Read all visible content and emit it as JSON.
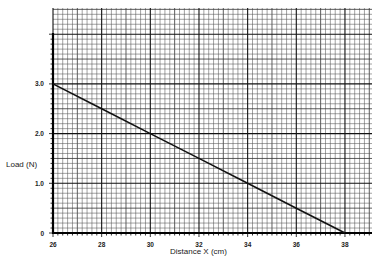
{
  "chart_data": {
    "type": "line",
    "title": "",
    "xlabel": "Distance X (cm)",
    "ylabel": "Load (N)",
    "xlim": [
      26,
      39.1
    ],
    "ylim": [
      0,
      4.5
    ],
    "x_ticks": [
      26,
      28,
      30,
      32,
      34,
      36,
      38
    ],
    "x_tick_labels": [
      "26",
      "28",
      "30",
      "32",
      "34",
      "36",
      "38"
    ],
    "y_ticks": [
      0,
      1.0,
      2.0,
      3.0
    ],
    "y_tick_labels": [
      "0",
      "1.0",
      "2.0",
      "3.0"
    ],
    "grid": true,
    "grid_style": "graph paper: minor lines every 0.2 cm and 0.1 N, major lines every 2 cm and 1 N",
    "legend": null,
    "series": [
      {
        "name": "Load vs Distance",
        "x": [
          26,
          28,
          30,
          32,
          34,
          36,
          38
        ],
        "y": [
          3.0,
          2.5,
          2.0,
          1.5,
          1.0,
          0.5,
          0.0
        ]
      }
    ]
  },
  "labels": {
    "xlabel": "Distance X (cm)",
    "ylabel": "Load (N)"
  },
  "geometry": {
    "x0_px": 53,
    "x_px_per_unit": 24.33,
    "y0_px": 233,
    "y_px_per_unit": 49.7,
    "grid_left": 53,
    "grid_right": 372,
    "grid_top": 8,
    "yaxis_top": 33
  }
}
